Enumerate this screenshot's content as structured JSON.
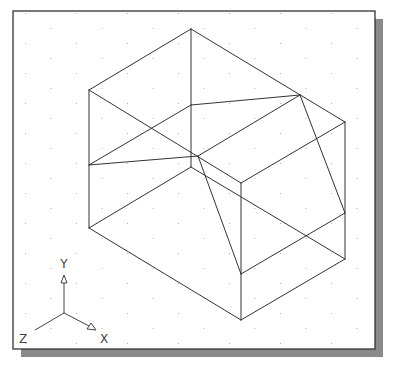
{
  "viewport": {
    "frame": {
      "x": 13,
      "y": 11,
      "width": 362,
      "height": 338
    },
    "shadow_offset": 8,
    "shadow_color": "#8a8a8a",
    "border_color": "#333333",
    "background": "#ffffff",
    "line_color": "#333333",
    "grid": {
      "dx": 25.5,
      "dy": 15,
      "dot_color": "#b0b0b0"
    }
  },
  "drawing": {
    "title": "Isometric wireframe block with sloped cut",
    "vertices": {
      "top": [
        191,
        29
      ],
      "left_top": [
        89,
        90
      ],
      "right_top": [
        345,
        122
      ],
      "front_top": [
        241,
        183
      ],
      "left_mid": [
        89,
        165
      ],
      "left_bottom": [
        89,
        228
      ],
      "inner_back": [
        191,
        167
      ],
      "inner_top": [
        191,
        105
      ],
      "cut_right": [
        300,
        95
      ],
      "cut_center": [
        198,
        156
      ],
      "right_mid": [
        345,
        213
      ],
      "right_bottom": [
        345,
        259
      ],
      "front_mid": [
        241,
        274
      ],
      "bottom": [
        241,
        320
      ]
    },
    "edges": [
      [
        "top",
        "left_top"
      ],
      [
        "top",
        "right_top"
      ],
      [
        "top",
        "inner_back"
      ],
      [
        "left_top",
        "front_top"
      ],
      [
        "right_top",
        "front_top"
      ],
      [
        "left_top",
        "left_bottom"
      ],
      [
        "right_top",
        "right_bottom"
      ],
      [
        "front_top",
        "bottom"
      ],
      [
        "left_bottom",
        "bottom"
      ],
      [
        "right_bottom",
        "bottom"
      ],
      [
        "inner_back",
        "left_bottom"
      ],
      [
        "inner_back",
        "right_bottom"
      ],
      [
        "inner_top",
        "cut_right"
      ],
      [
        "inner_top",
        "left_mid"
      ],
      [
        "left_mid",
        "cut_center"
      ],
      [
        "cut_center",
        "cut_right"
      ],
      [
        "cut_center",
        "front_mid"
      ],
      [
        "cut_right",
        "right_mid"
      ],
      [
        "right_mid",
        "front_mid"
      ]
    ]
  },
  "ucs_icon": {
    "origin": [
      64,
      313
    ],
    "x_axis": {
      "end": [
        96,
        330
      ],
      "label": "X",
      "label_pos": [
        104,
        343
      ]
    },
    "y_axis": {
      "end": [
        64,
        275
      ],
      "label": "Y",
      "label_pos": [
        64,
        268
      ]
    },
    "z_axis": {
      "end": [
        35,
        330
      ],
      "label": "Z",
      "label_pos": [
        23,
        343
      ]
    }
  }
}
